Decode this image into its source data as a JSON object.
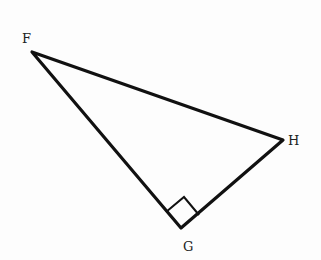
{
  "diagram": {
    "type": "right-triangle",
    "vertices": [
      {
        "name": "F",
        "x": 32,
        "y": 52,
        "label_x": 22,
        "label_y": 43
      },
      {
        "name": "G",
        "x": 181,
        "y": 228,
        "label_x": 183,
        "label_y": 250
      },
      {
        "name": "H",
        "x": 283,
        "y": 140,
        "label_x": 288,
        "label_y": 145
      }
    ],
    "right_angle_at": "G",
    "right_angle_marker": {
      "p1": [
        166,
        212
      ],
      "corner": [
        184,
        197
      ],
      "p2": [
        199,
        215
      ]
    },
    "stroke_color": "#111111",
    "labels": {
      "F": "F",
      "G": "G",
      "H": "H"
    }
  }
}
